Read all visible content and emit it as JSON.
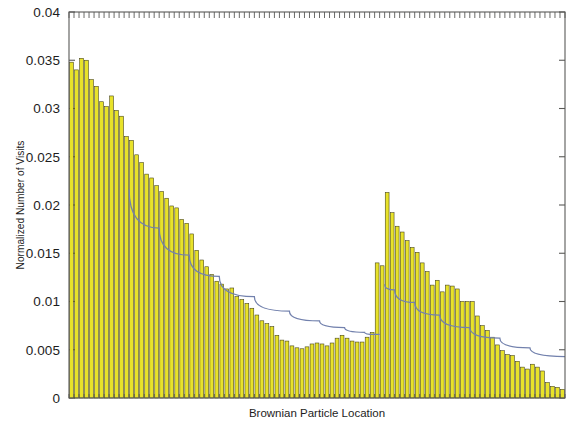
{
  "figure": {
    "background_color": "#ffffff",
    "plot_area": {
      "left": 69,
      "top": 12,
      "right": 565,
      "bottom": 398
    }
  },
  "chart_data": {
    "type": "bar",
    "title": "",
    "subtitle": "",
    "xlabel": "Brownian Particle Location",
    "ylabel": "Normalized Number of Visits",
    "xlim": [
      0,
      99
    ],
    "ylim": [
      0,
      0.04
    ],
    "ytick_labels": [
      "0",
      "0.005",
      "0.01",
      "0.015",
      "0.02",
      "0.025",
      "0.03",
      "0.035",
      "0.04"
    ],
    "ytick_values": [
      0,
      0.005,
      0.01,
      0.015,
      0.02,
      0.025,
      0.03,
      0.035,
      0.04
    ],
    "xtick_labels": [],
    "grid": false,
    "legend": null,
    "legend_position": "none",
    "bar_color": "#e8e22a",
    "bar_edge_color": "#3c3a16",
    "curve_color": "#7281ad",
    "annotations": [],
    "categories": [
      1,
      2,
      3,
      4,
      5,
      6,
      7,
      8,
      9,
      10,
      11,
      12,
      13,
      14,
      15,
      16,
      17,
      18,
      19,
      20,
      21,
      22,
      23,
      24,
      25,
      26,
      27,
      28,
      29,
      30,
      31,
      32,
      33,
      34,
      35,
      36,
      37,
      38,
      39,
      40,
      41,
      42,
      43,
      44,
      45,
      46,
      47,
      48,
      49,
      50,
      51,
      52,
      53,
      54,
      55,
      56,
      57,
      58,
      59,
      60,
      61,
      62,
      63,
      64,
      65,
      66,
      67,
      68,
      69,
      70,
      71,
      72,
      73,
      74,
      75,
      76,
      77,
      78,
      79,
      80,
      81,
      82,
      83,
      84,
      85,
      86,
      87,
      88,
      89,
      90,
      91,
      92,
      93,
      94,
      95,
      96,
      97,
      98,
      99
    ],
    "series": [
      {
        "name": "Normalized Number of Visits",
        "type": "bar",
        "values": [
          0.0348,
          0.034,
          0.0352,
          0.035,
          0.033,
          0.0323,
          0.0307,
          0.0302,
          0.0313,
          0.0298,
          0.0292,
          0.0271,
          0.0267,
          0.0252,
          0.0244,
          0.0232,
          0.0228,
          0.022,
          0.0214,
          0.0207,
          0.0199,
          0.0197,
          0.0185,
          0.0181,
          0.017,
          0.0153,
          0.0143,
          0.0136,
          0.0128,
          0.0121,
          0.0118,
          0.0113,
          0.0114,
          0.0105,
          0.0102,
          0.0098,
          0.0093,
          0.0086,
          0.008,
          0.0077,
          0.0074,
          0.0065,
          0.006,
          0.0059,
          0.0054,
          0.0052,
          0.0051,
          0.0053,
          0.0056,
          0.0057,
          0.0056,
          0.0054,
          0.0057,
          0.0062,
          0.0065,
          0.0062,
          0.0059,
          0.0058,
          0.0058,
          0.0063,
          0.0068,
          0.014,
          0.0137,
          0.0213,
          0.0192,
          0.0178,
          0.0172,
          0.0163,
          0.0156,
          0.0151,
          0.014,
          0.0131,
          0.0117,
          0.0122,
          0.011,
          0.0117,
          0.0116,
          0.0113,
          0.01,
          0.01,
          0.01,
          0.0085,
          0.0075,
          0.007,
          0.0063,
          0.0055,
          0.0049,
          0.0045,
          0.0044,
          0.0038,
          0.0032,
          0.003,
          0.0035,
          0.0032,
          0.0028,
          0.0016,
          0.0012,
          0.0011,
          0.0009
        ]
      },
      {
        "name": "fit-curve",
        "type": "line",
        "x": [
          0,
          3,
          7,
          12,
          18,
          24,
          30,
          37,
          44,
          50,
          55,
          59,
          61,
          62,
          63,
          65,
          69,
          74,
          80,
          86,
          92,
          99
        ],
        "values": [
          0.0355,
          0.031,
          0.0262,
          0.0216,
          0.0176,
          0.0148,
          0.0126,
          0.0105,
          0.009,
          0.008,
          0.0073,
          0.0068,
          0.0066,
          0.0066,
          0.0118,
          0.0112,
          0.0099,
          0.0086,
          0.0073,
          0.0062,
          0.0052,
          0.0043
        ]
      }
    ]
  }
}
